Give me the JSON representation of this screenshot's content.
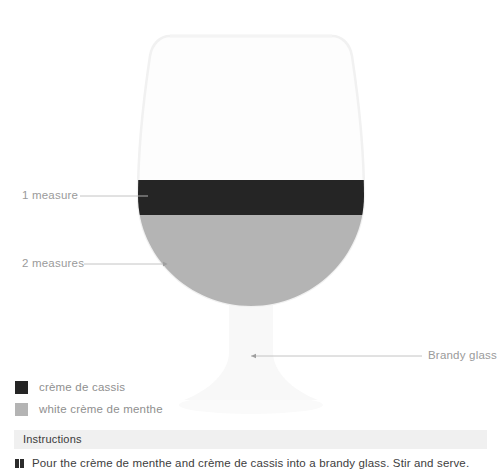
{
  "diagram": {
    "glass_type": "brandy-glass",
    "callouts": [
      {
        "key": "top_layer",
        "label": "1 measure"
      },
      {
        "key": "bottom_layer",
        "label": "2 measures"
      },
      {
        "key": "glassware",
        "label": "Brandy glass"
      }
    ]
  },
  "legend": {
    "items": [
      {
        "label": "crème de cassis",
        "color": "#252525",
        "swatch": "dark-swatch"
      },
      {
        "label": "white crème de menthe",
        "color": "#b4b4b4",
        "swatch": "light-swatch"
      }
    ]
  },
  "instructions": {
    "heading": "Instructions",
    "steps": [
      "Pour the crème de menthe and crème de cassis into a brandy glass. Stir and serve."
    ]
  },
  "colors": {
    "layer_top": "#252525",
    "layer_bottom": "#b4b4b4",
    "glass_outline": "#f2f2f2",
    "glass_fill": "#fcfcfc",
    "leader_line": "#b0b0b0",
    "label_text": "#9a9a9a",
    "instructions_bar": "#f0f0f0",
    "page_background": "#ffffff"
  }
}
